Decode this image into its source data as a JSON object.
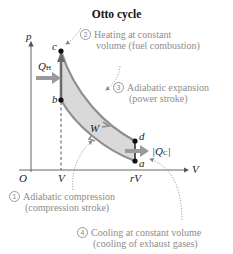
{
  "title": "Otto cycle",
  "axes": {
    "y_label": "p",
    "x_label": "V",
    "origin": "O",
    "x_ticks": [
      "V",
      "rV"
    ]
  },
  "points": {
    "a": "a",
    "b": "b",
    "c": "c",
    "d": "d"
  },
  "labels": {
    "qh": "Q",
    "qh_sub": "H",
    "qc": "|Q",
    "qc_sub": "C",
    "qc_end": "|",
    "work": "W"
  },
  "steps": [
    {
      "num": "1",
      "line1": "Adiabatic compression",
      "line2": "(compression stroke)"
    },
    {
      "num": "2",
      "line1": "Heating at constant",
      "line2": "volume (fuel combustion)"
    },
    {
      "num": "3",
      "line1": "Adiabatic expansion",
      "line2": "(power stroke)"
    },
    {
      "num": "4",
      "line1": "Cooling at constant volume",
      "line2": "(cooling of exhaust gases)"
    }
  ],
  "colors": {
    "fill": "#d9d9d9",
    "curve": "#8e8e8e",
    "arrow": "#9a9a9a",
    "axis": "#555555",
    "annotation": "#8c8c8c"
  }
}
